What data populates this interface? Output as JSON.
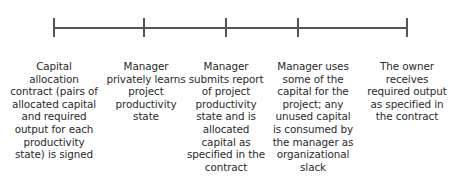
{
  "diagram": {
    "type": "timeline",
    "line_color": "#555555",
    "events": [
      {
        "tick_x": 54,
        "label": "Capital allocation contract (pairs of allocated capital and required output for each productivity state) is signed",
        "lines": [
          "Capital",
          "allocation",
          "contract (pairs of",
          "allocated capital",
          "and required",
          "output for each",
          "productivity",
          "state) is signed"
        ]
      },
      {
        "tick_x": 144,
        "label": "Manager privately learns project productivity state",
        "lines": [
          "Manager",
          "privately learns",
          "project",
          "productivity",
          "state"
        ]
      },
      {
        "tick_x": 226,
        "label": "Manager submits report of project productivity state and is allocated capital as specified in the contract",
        "lines": [
          "Manager",
          "submits report",
          "of project",
          "productivity",
          "state and is",
          "allocated",
          "capital as",
          "specified in the",
          "contract"
        ]
      },
      {
        "tick_x": 298,
        "label": "Manager uses some of the capital for the project; any unused capital is consumed by the manager as organizational slack",
        "lines": [
          "Manager uses",
          "some of the",
          "capital for the",
          "project; any",
          "unused capital",
          "is consumed by",
          "the manager as",
          "organizational",
          "slack"
        ]
      },
      {
        "tick_x": 407,
        "label": "The owner receives required output as specified in the contract",
        "lines": [
          "The owner",
          "receives",
          "required output",
          "as specified in",
          "the contract"
        ]
      }
    ]
  }
}
